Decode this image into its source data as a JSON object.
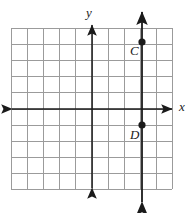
{
  "figure": {
    "type": "coordinate-grid-graph",
    "background_color": "#ffffff",
    "grid": {
      "color": "#9b9b9b",
      "left_px": 11,
      "top_px": 28,
      "cell_px": 16.1,
      "columns": 10,
      "rows": 10,
      "x_min": -5,
      "x_max": 5,
      "y_min": -5,
      "y_max": 5,
      "show_tick_numbers": false
    },
    "axes": {
      "color": "#1a1a1a",
      "x_axis": {
        "label": "x",
        "label_x_px": 179,
        "label_y_px": 101,
        "y_value": 0,
        "arrow_both_ends": true
      },
      "y_axis": {
        "label": "y",
        "label_x_px": 86,
        "label_y_px": 8,
        "x_value": 0,
        "arrow_both_ends": true
      }
    },
    "plotted_line": {
      "name": "vertical-line-CD",
      "color": "#1a1a1a",
      "orientation": "vertical",
      "equation": "x = 3",
      "x_value": 3,
      "arrow_both_ends": true
    },
    "points": [
      {
        "label": "C",
        "x": 3,
        "y": 4,
        "dot_x_px": 142,
        "dot_y_px": 42,
        "label_x_px": 130,
        "label_y_px": 44,
        "color": "#1a1a1a"
      },
      {
        "label": "D",
        "x": 3,
        "y": -1,
        "dot_x_px": 142,
        "dot_y_px": 125,
        "label_x_px": 130,
        "label_y_px": 128,
        "color": "#1a1a1a"
      }
    ]
  }
}
